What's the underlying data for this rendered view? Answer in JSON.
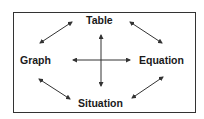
{
  "diagram": {
    "nodes": {
      "top": "Table",
      "left": "Graph",
      "right": "Equation",
      "bottom": "Situation"
    },
    "edges": [
      {
        "from": "Table",
        "to": "Graph",
        "type": "bidirectional"
      },
      {
        "from": "Table",
        "to": "Equation",
        "type": "bidirectional"
      },
      {
        "from": "Graph",
        "to": "Situation",
        "type": "bidirectional"
      },
      {
        "from": "Equation",
        "to": "Situation",
        "type": "bidirectional"
      },
      {
        "from": "Table",
        "to": "Situation",
        "type": "bidirectional"
      },
      {
        "from": "Graph",
        "to": "Equation",
        "type": "bidirectional"
      }
    ],
    "colors": {
      "stroke": "#333333",
      "text": "#1a1a1a",
      "background": "#ffffff"
    }
  }
}
